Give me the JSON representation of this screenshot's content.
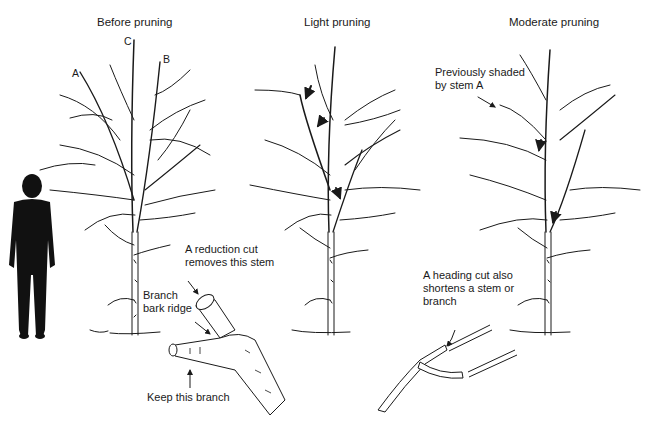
{
  "panels": [
    {
      "title": "Before pruning",
      "stem_labels": {
        "a": "A",
        "b": "B",
        "c": "C"
      }
    },
    {
      "title": "Light pruning"
    },
    {
      "title": "Moderate pruning"
    }
  ],
  "callouts": {
    "reduction_cut": [
      "A reduction cut",
      "removes this stem"
    ],
    "branch_bark_ridge": [
      "Branch",
      "bark ridge"
    ],
    "keep_branch": "Keep this branch",
    "previously_shaded": [
      "Previously shaded",
      "by stem A"
    ],
    "heading_cut": [
      "A heading cut also",
      "shortens a stem or",
      "branch"
    ]
  },
  "figures": {
    "human_silhouette": "person-for-scale",
    "trees": [
      "before-pruning-tree",
      "light-pruning-tree",
      "moderate-pruning-tree"
    ],
    "details": [
      "reduction-cut-detail",
      "heading-cut-detail"
    ]
  },
  "colors": {
    "ink": "#1a1a1a",
    "background": "#ffffff"
  }
}
